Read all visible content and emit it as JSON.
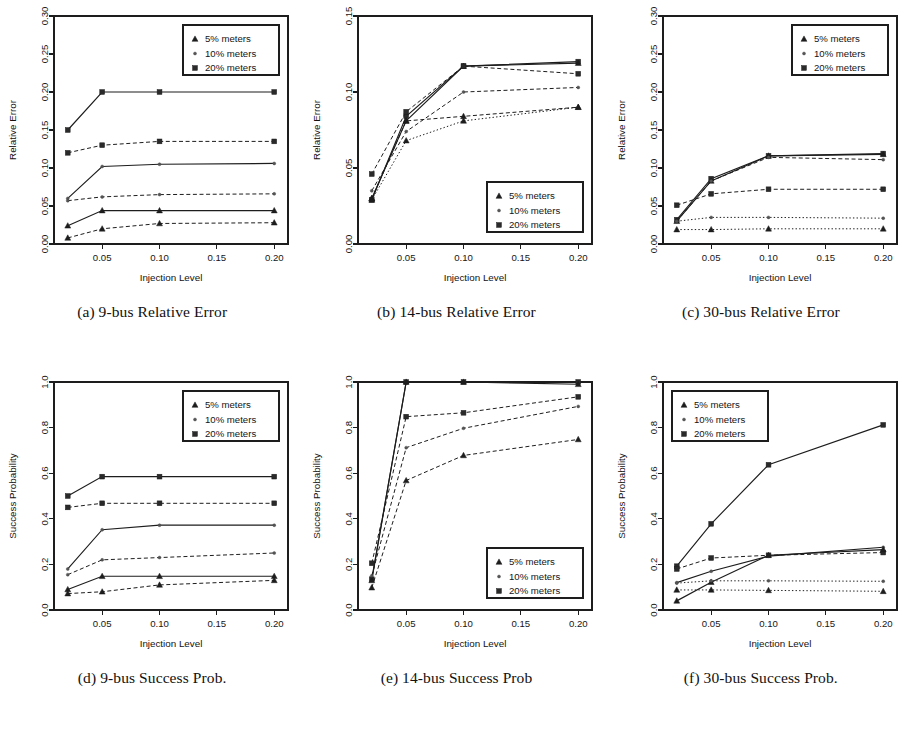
{
  "figure": {
    "background_color": "#ffffff",
    "ink_color": "#1d1d1d",
    "x_label": "Injection Level",
    "x_ticks": [
      "0.05",
      "0.10",
      "0.15",
      "0.20"
    ],
    "x_tick_values": [
      0.05,
      0.1,
      0.15,
      0.2
    ],
    "x_data_values": [
      0.02,
      0.05,
      0.1,
      0.2
    ],
    "x_range": [
      0.008,
      0.212
    ],
    "legend_entries": [
      {
        "label": "5% meters",
        "marker": "triangle-up-marker"
      },
      {
        "label": "10% meters",
        "marker": "small-circle-marker"
      },
      {
        "label": "20% meters",
        "marker": "square-marker"
      }
    ]
  },
  "panels": [
    {
      "id": "panel-a",
      "caption": "(a) 9-bus Relative Error",
      "y_label": "Relative Error",
      "y_ticks": [
        "0.00",
        "0.05",
        "0.10",
        "0.15",
        "0.20",
        "0.25",
        "0.30"
      ],
      "legend_position": "top-right",
      "chart_data": {
        "type": "line",
        "title": "(a) 9-bus Relative Error",
        "xlabel": "Injection Level",
        "ylabel": "Relative Error",
        "x": [
          0.02,
          0.05,
          0.1,
          0.2
        ],
        "xlim": [
          0.008,
          0.212
        ],
        "ylim": [
          0.0,
          0.3
        ],
        "grid": false,
        "legend": "top-right",
        "series": [
          {
            "name": "20% meters (solid)",
            "marker": "square",
            "style": "solid",
            "values": [
              0.15,
              0.2,
              0.2,
              0.2
            ]
          },
          {
            "name": "20% meters (dashed)",
            "marker": "square",
            "style": "dashed",
            "values": [
              0.12,
              0.13,
              0.135,
              0.135
            ]
          },
          {
            "name": "10% meters (solid)",
            "marker": "circle",
            "style": "solid",
            "values": [
              0.06,
              0.102,
              0.105,
              0.106
            ]
          },
          {
            "name": "10% meters (dashed)",
            "marker": "circle",
            "style": "dashed",
            "values": [
              0.057,
              0.062,
              0.065,
              0.066
            ]
          },
          {
            "name": "5% meters (solid)",
            "marker": "triangle",
            "style": "solid",
            "values": [
              0.024,
              0.044,
              0.044,
              0.044
            ]
          },
          {
            "name": "5% meters (dashed)",
            "marker": "triangle",
            "style": "dashed",
            "values": [
              0.008,
              0.02,
              0.027,
              0.028
            ]
          }
        ]
      }
    },
    {
      "id": "panel-b",
      "caption": "(b) 14-bus Relative Error",
      "y_label": "Relative Error",
      "y_ticks": [
        "0.00",
        "0.05",
        "0.10",
        "0.15"
      ],
      "legend_position": "bottom-right",
      "chart_data": {
        "type": "line",
        "title": "(b) 14-bus Relative Error",
        "xlabel": "Injection Level",
        "ylabel": "Relative Error",
        "x": [
          0.02,
          0.05,
          0.1,
          0.2
        ],
        "xlim": [
          0.008,
          0.212
        ],
        "ylim": [
          0.0,
          0.15
        ],
        "grid": false,
        "legend": "bottom-right",
        "series": [
          {
            "name": "20% meters (solid)",
            "marker": "square",
            "style": "solid",
            "values": [
              0.029,
              0.084,
              0.117,
              0.12
            ]
          },
          {
            "name": "5% meters (solid)",
            "marker": "triangle",
            "style": "solid",
            "values": [
              0.03,
              0.081,
              0.117,
              0.119
            ]
          },
          {
            "name": "20% meters (dashed)",
            "marker": "square",
            "style": "dashed",
            "values": [
              0.046,
              0.087,
              0.117,
              0.112
            ]
          },
          {
            "name": "10% meters (dashed)",
            "marker": "circle",
            "style": "dashed",
            "values": [
              0.035,
              0.074,
              0.1,
              0.103
            ]
          },
          {
            "name": "5% meters (dashed)",
            "marker": "triangle",
            "style": "dashed",
            "values": [
              0.03,
              0.081,
              0.084,
              0.09
            ]
          },
          {
            "name": "5% meters (dotted)",
            "marker": "triangle",
            "style": "dotted",
            "values": [
              0.029,
              0.068,
              0.081,
              0.09
            ]
          }
        ]
      }
    },
    {
      "id": "panel-c",
      "caption": "(c) 30-bus Relative Error",
      "y_label": "Relative Error",
      "y_ticks": [
        "0.00",
        "0.05",
        "0.10",
        "0.15",
        "0.20",
        "0.25",
        "0.30"
      ],
      "legend_position": "top-right",
      "chart_data": {
        "type": "line",
        "title": "(c) 30-bus Relative Error",
        "xlabel": "Injection Level",
        "ylabel": "Relative Error",
        "x": [
          0.02,
          0.05,
          0.1,
          0.2
        ],
        "xlim": [
          0.008,
          0.212
        ],
        "ylim": [
          0.0,
          0.3
        ],
        "grid": false,
        "legend": "top-right",
        "series": [
          {
            "name": "20% meters (solid)",
            "marker": "square",
            "style": "solid",
            "values": [
              0.032,
              0.086,
              0.116,
              0.119
            ]
          },
          {
            "name": "5% meters (solid)",
            "marker": "triangle",
            "style": "solid",
            "values": [
              0.03,
              0.083,
              0.116,
              0.118
            ]
          },
          {
            "name": "10% meters (dashed)",
            "marker": "circle",
            "style": "dashed",
            "values": [
              0.03,
              0.083,
              0.114,
              0.111
            ]
          },
          {
            "name": "20% meters (dashed)",
            "marker": "square",
            "style": "dashed",
            "values": [
              0.051,
              0.066,
              0.072,
              0.072
            ]
          },
          {
            "name": "10% meters (dotted)",
            "marker": "circle",
            "style": "dotted",
            "values": [
              0.03,
              0.035,
              0.035,
              0.034
            ]
          },
          {
            "name": "5% meters (dotted)",
            "marker": "triangle",
            "style": "dotted",
            "values": [
              0.019,
              0.019,
              0.02,
              0.02
            ]
          }
        ]
      }
    },
    {
      "id": "panel-d",
      "caption": "(d) 9-bus Success Prob.",
      "y_label": "Success Probability",
      "y_ticks": [
        "0.0",
        "0.2",
        "0.4",
        "0.6",
        "0.8",
        "1.0"
      ],
      "legend_position": "top-right",
      "chart_data": {
        "type": "line",
        "title": "(d) 9-bus Success Prob.",
        "xlabel": "Injection Level",
        "ylabel": "Success Probability",
        "x": [
          0.02,
          0.05,
          0.1,
          0.2
        ],
        "xlim": [
          0.008,
          0.212
        ],
        "ylim": [
          0.0,
          1.0
        ],
        "grid": false,
        "legend": "top-right",
        "series": [
          {
            "name": "20% meters (solid)",
            "marker": "square",
            "style": "solid",
            "values": [
              0.5,
              0.585,
              0.585,
              0.585
            ]
          },
          {
            "name": "20% meters (dashed)",
            "marker": "square",
            "style": "dashed",
            "values": [
              0.45,
              0.468,
              0.468,
              0.468
            ]
          },
          {
            "name": "10% meters (solid)",
            "marker": "circle",
            "style": "solid",
            "values": [
              0.18,
              0.352,
              0.372,
              0.372
            ]
          },
          {
            "name": "10% meters (dashed)",
            "marker": "circle",
            "style": "dashed",
            "values": [
              0.155,
              0.22,
              0.23,
              0.25
            ]
          },
          {
            "name": "5% meters (solid)",
            "marker": "triangle",
            "style": "solid",
            "values": [
              0.09,
              0.148,
              0.148,
              0.148
            ]
          },
          {
            "name": "5% meters (dashed)",
            "marker": "triangle",
            "style": "dashed",
            "values": [
              0.072,
              0.08,
              0.11,
              0.13
            ]
          }
        ]
      }
    },
    {
      "id": "panel-e",
      "caption": "(e) 14-bus Success Prob",
      "y_label": "Success Probability",
      "y_ticks": [
        "0.0",
        "0.2",
        "0.4",
        "0.6",
        "0.8",
        "1.0"
      ],
      "legend_position": "bottom-right",
      "chart_data": {
        "type": "line",
        "title": "(e) 14-bus Success Prob",
        "xlabel": "Injection Level",
        "ylabel": "Success Probability",
        "x": [
          0.02,
          0.05,
          0.1,
          0.2
        ],
        "xlim": [
          0.008,
          0.212
        ],
        "ylim": [
          0.0,
          1.0
        ],
        "grid": false,
        "legend": "bottom-right",
        "series": [
          {
            "name": "20% meters (solid)",
            "marker": "square",
            "style": "solid",
            "values": [
              0.135,
              1.0,
              1.0,
              1.0
            ]
          },
          {
            "name": "5% meters (solid)",
            "marker": "triangle",
            "style": "solid",
            "values": [
              0.13,
              1.0,
              1.0,
              0.99
            ]
          },
          {
            "name": "20% meters (dashed)",
            "marker": "square",
            "style": "dashed",
            "values": [
              0.205,
              0.848,
              0.865,
              0.935
            ]
          },
          {
            "name": "10% meters (dashed)",
            "marker": "circle",
            "style": "dashed",
            "values": [
              0.15,
              0.712,
              0.797,
              0.893
            ]
          },
          {
            "name": "5% meters (dashed)",
            "marker": "triangle",
            "style": "dashed",
            "values": [
              0.098,
              0.568,
              0.678,
              0.748
            ]
          }
        ]
      }
    },
    {
      "id": "panel-f",
      "caption": "(f) 30-bus Success Prob.",
      "y_label": "Success Probability",
      "y_ticks": [
        "0.0",
        "0.2",
        "0.4",
        "0.6",
        "0.8",
        "1.0"
      ],
      "legend_position": "top-left",
      "chart_data": {
        "type": "line",
        "title": "(f) 30-bus Success Prob.",
        "xlabel": "Injection Level",
        "ylabel": "Success Probability",
        "x": [
          0.02,
          0.05,
          0.1,
          0.2
        ],
        "xlim": [
          0.008,
          0.212
        ],
        "ylim": [
          0.0,
          1.0
        ],
        "grid": false,
        "legend": "top-left",
        "series": [
          {
            "name": "20% meters (solid)",
            "marker": "square",
            "style": "solid",
            "values": [
              0.192,
              0.378,
              0.637,
              0.812
            ]
          },
          {
            "name": "20% meters (dashed)",
            "marker": "square",
            "style": "dashed",
            "values": [
              0.18,
              0.228,
              0.24,
              0.252
            ]
          },
          {
            "name": "10% meters (solid)",
            "marker": "circle",
            "style": "solid",
            "values": [
              0.12,
              0.17,
              0.236,
              0.275
            ]
          },
          {
            "name": "5% meters (solid)",
            "marker": "triangle",
            "style": "solid",
            "values": [
              0.04,
              0.122,
              0.24,
              0.265
            ]
          },
          {
            "name": "10% meters (dotted)",
            "marker": "circle",
            "style": "dotted",
            "values": [
              0.118,
              0.128,
              0.128,
              0.126
            ]
          },
          {
            "name": "5% meters (dotted)",
            "marker": "triangle",
            "style": "dotted",
            "values": [
              0.088,
              0.088,
              0.086,
              0.082
            ]
          }
        ]
      }
    }
  ]
}
